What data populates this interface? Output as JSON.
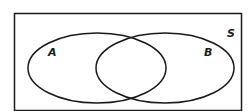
{
  "diagram": {
    "type": "venn",
    "universe_label": "S",
    "sets": [
      {
        "label": "A"
      },
      {
        "label": "B"
      }
    ],
    "colors": {
      "stroke": "#1a1a1a",
      "background": "#ffffff"
    }
  }
}
